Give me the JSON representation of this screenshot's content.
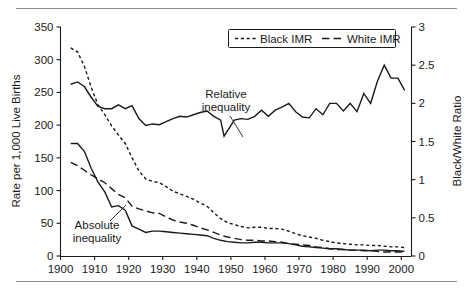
{
  "figure": {
    "has_top_rule": true,
    "has_bottom_rule": true,
    "rule_color": "#8c8c8c",
    "line_color": "#1a1a1a",
    "background": "#ffffff"
  },
  "legend": {
    "position": "top-center",
    "entries": [
      {
        "label": "Black IMR",
        "style": "dotted"
      },
      {
        "label": "White IMR",
        "style": "dashed"
      }
    ]
  },
  "annotations": [
    {
      "name": "relative-inequality",
      "line1": "Relative",
      "line2": "inequality"
    },
    {
      "name": "absolute-inequality",
      "line1": "Absolute",
      "line2": "inequality"
    }
  ],
  "chart_data": {
    "type": "line",
    "title": "",
    "xlabel": "",
    "ylabel": "Rate per 1,000 Live Births",
    "y2label": "Black/White Ratio",
    "xlim": [
      1900,
      2003
    ],
    "ylim": [
      0,
      350
    ],
    "y2lim": [
      0,
      3
    ],
    "grid": false,
    "xticks": [
      1900,
      1910,
      1920,
      1930,
      1940,
      1950,
      1960,
      1970,
      1980,
      1990,
      2000
    ],
    "xtick_labels": [
      "1900",
      "1910",
      "1920",
      "1930",
      "1940",
      "1950",
      "1960",
      "1970",
      "1980",
      "1990",
      "2000"
    ],
    "yticks": [
      0,
      50,
      100,
      150,
      200,
      250,
      300,
      350
    ],
    "ytick_labels": [
      "0",
      "50",
      "100",
      "150",
      "200",
      "250",
      "300",
      "350"
    ],
    "y2ticks": [
      0,
      0.5,
      1,
      1.5,
      2,
      2.5,
      3
    ],
    "y2tick_labels": [
      "0",
      "0.5",
      "1",
      "1.5",
      "2",
      "2.5",
      "3"
    ],
    "legend_position": "top-center",
    "series": [
      {
        "name": "Black IMR",
        "style": "dotted",
        "axis": "left",
        "x": [
          1903,
          1905,
          1907,
          1909,
          1911,
          1913,
          1915,
          1917,
          1919,
          1921,
          1923,
          1925,
          1927,
          1929,
          1931,
          1933,
          1935,
          1937,
          1939,
          1941,
          1943,
          1945,
          1947,
          1949,
          1951,
          1953,
          1955,
          1957,
          1959,
          1961,
          1963,
          1965,
          1967,
          1969,
          1971,
          1973,
          1975,
          1977,
          1979,
          1981,
          1983,
          1985,
          1987,
          1989,
          1991,
          1993,
          1995,
          1997,
          1999,
          2001
        ],
        "y": [
          318,
          312,
          290,
          258,
          231,
          216,
          199,
          185,
          172,
          150,
          130,
          118,
          114,
          112,
          106,
          99,
          95,
          91,
          87,
          81,
          76,
          66,
          57,
          51,
          48,
          45,
          43,
          44,
          44,
          42,
          42,
          41,
          38,
          34,
          31,
          29,
          27,
          24,
          22,
          20,
          19,
          18,
          17,
          17,
          16,
          16,
          15,
          14,
          14,
          13
        ]
      },
      {
        "name": "White IMR",
        "style": "dashed",
        "axis": "left",
        "x": [
          1903,
          1905,
          1907,
          1909,
          1911,
          1913,
          1915,
          1917,
          1919,
          1921,
          1923,
          1925,
          1927,
          1929,
          1931,
          1933,
          1935,
          1937,
          1939,
          1941,
          1943,
          1945,
          1947,
          1949,
          1951,
          1953,
          1955,
          1957,
          1959,
          1961,
          1963,
          1965,
          1967,
          1969,
          1971,
          1973,
          1975,
          1977,
          1979,
          1981,
          1983,
          1985,
          1987,
          1989,
          1991,
          1993,
          1995,
          1997,
          1999,
          2001
        ],
        "y": [
          143,
          138,
          131,
          124,
          118,
          112,
          103,
          94,
          89,
          76,
          72,
          69,
          66,
          65,
          60,
          55,
          52,
          50,
          47,
          43,
          40,
          36,
          32,
          29,
          27,
          25,
          24,
          24,
          23,
          23,
          22,
          21,
          19,
          18,
          17,
          16,
          14,
          13,
          11,
          10,
          10,
          9,
          9,
          8,
          8,
          7,
          6,
          6,
          6,
          6
        ]
      },
      {
        "name": "Absolute inequality",
        "style": "solid",
        "axis": "left",
        "x": [
          1903,
          1905,
          1907,
          1909,
          1911,
          1913,
          1915,
          1917,
          1919,
          1921,
          1923,
          1925,
          1927,
          1929,
          1931,
          1933,
          1935,
          1937,
          1939,
          1941,
          1943,
          1945,
          1947,
          1949,
          1951,
          1953,
          1955,
          1957,
          1959,
          1961,
          1963,
          1965,
          1967,
          1969,
          1971,
          1973,
          1975,
          1977,
          1979,
          1981,
          1983,
          1985,
          1987,
          1989,
          1991,
          1993,
          1995,
          1997,
          1999,
          2001
        ],
        "y": [
          172,
          172,
          160,
          134,
          113,
          98,
          75,
          77,
          70,
          46,
          41,
          36,
          38,
          38,
          37,
          36,
          35,
          34,
          33,
          32,
          31,
          27,
          24,
          22,
          21,
          20,
          20,
          21,
          21,
          20,
          20,
          20,
          19,
          17,
          15,
          14,
          13,
          12,
          11,
          11,
          10,
          9,
          9,
          9,
          8,
          9,
          9,
          8,
          8,
          7
        ]
      },
      {
        "name": "Relative inequality",
        "style": "solid",
        "axis": "right",
        "x": [
          1903,
          1905,
          1907,
          1909,
          1911,
          1913,
          1915,
          1917,
          1919,
          1921,
          1923,
          1925,
          1927,
          1929,
          1931,
          1933,
          1935,
          1937,
          1939,
          1941,
          1943,
          1945,
          1947,
          1948,
          1949,
          1951,
          1953,
          1955,
          1957,
          1959,
          1961,
          1963,
          1965,
          1967,
          1969,
          1971,
          1973,
          1975,
          1977,
          1979,
          1981,
          1983,
          1985,
          1987,
          1989,
          1991,
          1993,
          1995,
          1997,
          1999,
          2001
        ],
        "y": [
          2.25,
          2.28,
          2.22,
          2.08,
          1.96,
          1.93,
          1.93,
          1.98,
          1.93,
          1.97,
          1.8,
          1.71,
          1.73,
          1.72,
          1.76,
          1.8,
          1.83,
          1.82,
          1.85,
          1.88,
          1.9,
          1.83,
          1.78,
          1.57,
          1.64,
          1.78,
          1.8,
          1.79,
          1.83,
          1.91,
          1.83,
          1.91,
          1.95,
          2.0,
          1.89,
          1.82,
          1.81,
          1.93,
          1.85,
          2.0,
          2.0,
          1.9,
          2.0,
          1.89,
          2.13,
          2.0,
          2.29,
          2.5,
          2.33,
          2.33,
          2.17
        ]
      }
    ]
  }
}
